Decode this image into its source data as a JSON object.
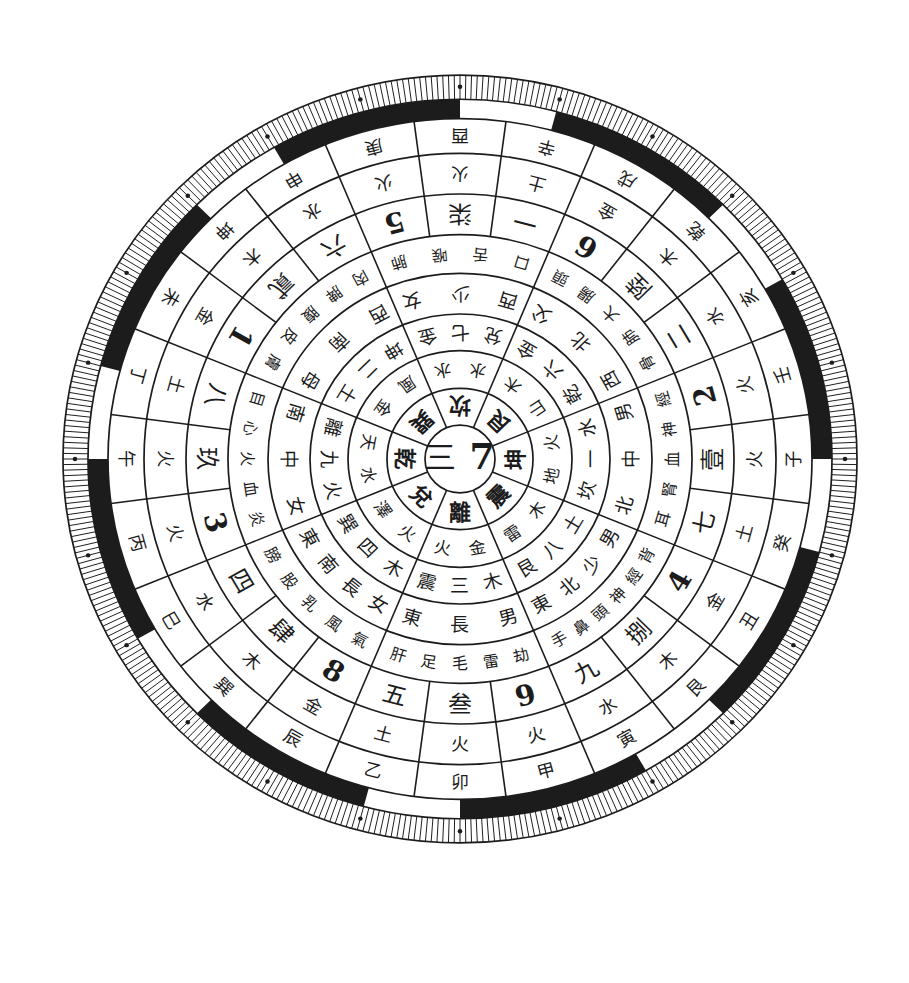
{
  "diagram": {
    "center": {
      "numeral": "三",
      "number": "7"
    },
    "sectors": [
      {
        "angle": 0,
        "trigram": "坤",
        "nature": "地火",
        "later_heaven": "坎一水",
        "family": "北中男",
        "body": "耳腎血神經"
      },
      {
        "angle": 45,
        "trigram": "艮",
        "nature": "山木",
        "later_heaven": "乾六金",
        "family": "西北父",
        "body": "骨肺大腸頭"
      },
      {
        "angle": 90,
        "trigram": "坎",
        "nature": "水水",
        "later_heaven": "兌七金",
        "family": "西少女",
        "body": "口舌喉肺"
      },
      {
        "angle": 135,
        "trigram": "巽",
        "nature": "風金",
        "later_heaven": "坤二土",
        "family": "西南母",
        "body": "肉脾腹皮膚"
      },
      {
        "angle": 180,
        "trigram": "乾",
        "nature": "天水",
        "later_heaven": "離九火",
        "family": "南中女",
        "body": "目心火血炎"
      },
      {
        "angle": 225,
        "trigram": "兌",
        "nature": "澤火",
        "later_heaven": "巽四木",
        "family": "東南長女",
        "body": "膀股乳風氣"
      },
      {
        "angle": 270,
        "trigram": "離",
        "nature": "火金",
        "later_heaven": "震三木",
        "family": "東長男",
        "body": "肝足毛雷劫"
      },
      {
        "angle": 315,
        "trigram": "震",
        "nature": "雷木",
        "later_heaven": "艮八土",
        "family": "東北少男",
        "body": "手鼻頭神經背"
      }
    ],
    "mountains": [
      {
        "angle": 0,
        "name": "子",
        "element": "火",
        "number": "壹"
      },
      {
        "angle": 15,
        "name": "壬",
        "element": "火",
        "number": "2"
      },
      {
        "angle": 30,
        "name": "亥",
        "element": "水",
        "number": "二"
      },
      {
        "angle": 45,
        "name": "乾",
        "element": "木",
        "number": "陸"
      },
      {
        "angle": 60,
        "name": "戌",
        "element": "金",
        "number": "6"
      },
      {
        "angle": 75,
        "name": "辛",
        "element": "土",
        "number": "一"
      },
      {
        "angle": 90,
        "name": "酉",
        "element": "火",
        "number": "柒"
      },
      {
        "angle": 105,
        "name": "庚",
        "element": "火",
        "number": "5"
      },
      {
        "angle": 120,
        "name": "申",
        "element": "水",
        "number": "六"
      },
      {
        "angle": 135,
        "name": "坤",
        "element": "木",
        "number": "貳"
      },
      {
        "angle": 150,
        "name": "未",
        "element": "金",
        "number": "1"
      },
      {
        "angle": 165,
        "name": "丁",
        "element": "土",
        "number": "八"
      },
      {
        "angle": 180,
        "name": "午",
        "element": "火",
        "number": "玖"
      },
      {
        "angle": 195,
        "name": "丙",
        "element": "火",
        "number": "3"
      },
      {
        "angle": 210,
        "name": "巳",
        "element": "水",
        "number": "四"
      },
      {
        "angle": 225,
        "name": "巽",
        "element": "木",
        "number": "肆"
      },
      {
        "angle": 240,
        "name": "辰",
        "element": "金",
        "number": "8"
      },
      {
        "angle": 255,
        "name": "乙",
        "element": "土",
        "number": "五"
      },
      {
        "angle": 270,
        "name": "卯",
        "element": "火",
        "number": "叁"
      },
      {
        "angle": 285,
        "name": "甲",
        "element": "火",
        "number": "9"
      },
      {
        "angle": 300,
        "name": "寅",
        "element": "水",
        "number": "九"
      },
      {
        "angle": 315,
        "name": "艮",
        "element": "木",
        "number": "捌"
      },
      {
        "angle": 330,
        "name": "丑",
        "element": "金",
        "number": "4"
      },
      {
        "angle": 345,
        "name": "癸",
        "element": "土",
        "number": "七"
      }
    ],
    "band": {
      "dark_segments_deg": [
        [
          270,
          300
        ],
        [
          315,
          345
        ],
        [
          0,
          30
        ],
        [
          45,
          75
        ],
        [
          90,
          120
        ],
        [
          135,
          165
        ],
        [
          180,
          210
        ],
        [
          225,
          255
        ]
      ]
    }
  },
  "colors": {
    "ink": "#1c1c1c",
    "paper": "#ffffff"
  }
}
